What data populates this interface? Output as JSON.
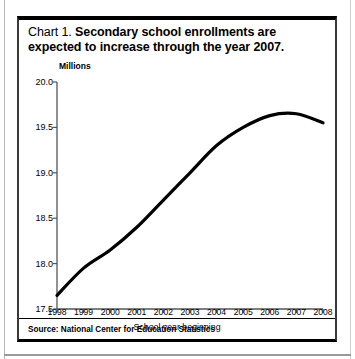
{
  "figure": {
    "title_lead": "Chart 1.",
    "title_main": "Secondary school enrollments are expected to increase through the year 2007.",
    "source": "Source: National Center for Education Statistics"
  },
  "chart_data": {
    "type": "line",
    "title": "Chart 1.  Secondary school enrollments are expected to increase through the year 2007.",
    "units_label": "Millions",
    "xlabel": "School year beginning",
    "ylabel": "Millions",
    "categories": [
      "1998",
      "1999",
      "2000",
      "2001",
      "2002",
      "2003",
      "2004",
      "2005",
      "2006",
      "2007",
      "2008"
    ],
    "x": [
      1998,
      1999,
      2000,
      2001,
      2002,
      2003,
      2004,
      2005,
      2006,
      2007,
      2008
    ],
    "values": [
      17.65,
      17.95,
      18.15,
      18.4,
      18.7,
      19.0,
      19.3,
      19.5,
      19.63,
      19.65,
      19.55
    ],
    "ylim": [
      17.5,
      20.0
    ],
    "xlim": [
      1998,
      2008
    ],
    "yticks": [
      "20.0",
      "19.5",
      "19.0",
      "18.5",
      "18.0",
      "17.5"
    ],
    "ytick_values": [
      20.0,
      19.5,
      19.0,
      18.5,
      18.0,
      17.5
    ],
    "grid": false,
    "legend": false,
    "line_color": "#000000"
  }
}
